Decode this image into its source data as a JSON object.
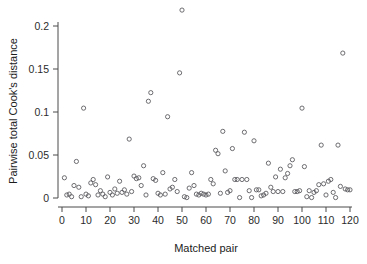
{
  "figure": {
    "background_color": "#ffffff",
    "axis_color": "#4a4a4a",
    "point_color": "#55555a"
  },
  "axes": {
    "x_title": "Matched pair",
    "y_title": "Pairwise total Cook's distance",
    "x_ticks": [
      "0",
      "10",
      "20",
      "30",
      "40",
      "50",
      "60",
      "70",
      "80",
      "90",
      "100",
      "110",
      "120"
    ],
    "y_ticks": [
      "0",
      "0.05",
      "0.1",
      "0.15",
      "0.2"
    ]
  },
  "chart_data": {
    "type": "scatter",
    "title": "",
    "xlabel": "Matched pair",
    "ylabel": "Pairwise total Cook's distance",
    "xlim": [
      0,
      120
    ],
    "ylim": [
      0,
      0.22
    ],
    "xticks": [
      0,
      10,
      20,
      30,
      40,
      50,
      60,
      70,
      80,
      90,
      100,
      110,
      120
    ],
    "yticks": [
      0,
      0.05,
      0.1,
      0.15,
      0.2
    ],
    "grid": false,
    "legend": null,
    "marker": "open-circle",
    "series": [
      {
        "name": "Pairwise total Cook's distance",
        "points": [
          [
            1,
            0.0235
          ],
          [
            2,
            0.0035
          ],
          [
            3,
            0.0045
          ],
          [
            4,
            0.0015
          ],
          [
            5,
            0.0145
          ],
          [
            6,
            0.0425
          ],
          [
            7,
            0.0125
          ],
          [
            8,
            0.0015
          ],
          [
            9,
            0.1045
          ],
          [
            10,
            0.0045
          ],
          [
            11,
            0.0025
          ],
          [
            12,
            0.0175
          ],
          [
            13,
            0.0215
          ],
          [
            14,
            0.0155
          ],
          [
            15,
            0.0035
          ],
          [
            16,
            0.0085
          ],
          [
            17,
            0.0045
          ],
          [
            18,
            0.0015
          ],
          [
            19,
            0.0245
          ],
          [
            20,
            0.0065
          ],
          [
            21,
            0.0035
          ],
          [
            22,
            0.0105
          ],
          [
            23,
            0.0055
          ],
          [
            24,
            0.0195
          ],
          [
            25,
            0.0065
          ],
          [
            26,
            0.0095
          ],
          [
            27,
            0.0045
          ],
          [
            28,
            0.0685
          ],
          [
            29,
            0.0075
          ],
          [
            30,
            0.0255
          ],
          [
            31,
            0.0225
          ],
          [
            32,
            0.0235
          ],
          [
            33,
            0.0145
          ],
          [
            34,
            0.0375
          ],
          [
            35,
            0.0035
          ],
          [
            36,
            0.1125
          ],
          [
            37,
            0.1225
          ],
          [
            38,
            0.0225
          ],
          [
            39,
            0.0205
          ],
          [
            40,
            0.0055
          ],
          [
            41,
            0.0035
          ],
          [
            42,
            0.0295
          ],
          [
            43,
            0.0045
          ],
          [
            44,
            0.0945
          ],
          [
            45,
            0.0105
          ],
          [
            46,
            0.0125
          ],
          [
            47,
            0.0215
          ],
          [
            48,
            0.0075
          ],
          [
            49,
            0.1455
          ],
          [
            50,
            0.2185
          ],
          [
            51,
            0.0015
          ],
          [
            52,
            0.0005
          ],
          [
            53,
            0.0115
          ],
          [
            54,
            0.0295
          ],
          [
            55,
            0.0145
          ],
          [
            56,
            0.0045
          ],
          [
            57,
            0.0035
          ],
          [
            58,
            0.0055
          ],
          [
            59,
            0.0045
          ],
          [
            60,
            0.0035
          ],
          [
            61,
            0.0045
          ],
          [
            62,
            0.0215
          ],
          [
            63,
            0.0165
          ],
          [
            64,
            0.0555
          ],
          [
            65,
            0.0515
          ],
          [
            66,
            0.0055
          ],
          [
            67,
            0.0775
          ],
          [
            68,
            0.0315
          ],
          [
            69,
            0.0065
          ],
          [
            70,
            0.0085
          ],
          [
            71,
            0.0575
          ],
          [
            72,
            0.0215
          ],
          [
            73,
            0.0215
          ],
          [
            74,
            0.0005
          ],
          [
            75,
            0.0215
          ],
          [
            76,
            0.0765
          ],
          [
            77,
            0.0215
          ],
          [
            78,
            0.0085
          ],
          [
            79,
            0.0005
          ],
          [
            80,
            0.0665
          ],
          [
            81,
            0.0095
          ],
          [
            82,
            0.0095
          ],
          [
            83,
            0.0025
          ],
          [
            84,
            0.0035
          ],
          [
            85,
            0.0055
          ],
          [
            86,
            0.0405
          ],
          [
            87,
            0.0125
          ],
          [
            88,
            0.0075
          ],
          [
            89,
            0.0245
          ],
          [
            90,
            0.0075
          ],
          [
            91,
            0.0335
          ],
          [
            92,
            0.0075
          ],
          [
            93,
            0.0235
          ],
          [
            94,
            0.0285
          ],
          [
            95,
            0.0375
          ],
          [
            96,
            0.0445
          ],
          [
            97,
            0.0075
          ],
          [
            98,
            0.0075
          ],
          [
            99,
            0.0085
          ],
          [
            100,
            0.1045
          ],
          [
            101,
            0.0365
          ],
          [
            102,
            0.0015
          ],
          [
            103,
            0.0085
          ],
          [
            104,
            0.0005
          ],
          [
            105,
            0.0065
          ],
          [
            106,
            0.0085
          ],
          [
            107,
            0.0155
          ],
          [
            108,
            0.0615
          ],
          [
            109,
            0.0165
          ],
          [
            110,
            0.0035
          ],
          [
            111,
            0.0195
          ],
          [
            112,
            0.0215
          ],
          [
            113,
            0.0065
          ],
          [
            114,
            0.0005
          ],
          [
            115,
            0.0615
          ],
          [
            116,
            0.0135
          ],
          [
            117,
            0.1685
          ],
          [
            118,
            0.0105
          ],
          [
            119,
            0.0095
          ],
          [
            120,
            0.0095
          ]
        ]
      }
    ]
  }
}
